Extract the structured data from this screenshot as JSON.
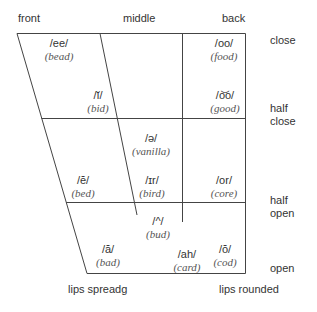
{
  "columns": {
    "front": "front",
    "middle": "middle",
    "back": "back"
  },
  "rows": {
    "close": "close",
    "half_close_1": "half",
    "half_close_2": "close",
    "half_open_1": "half",
    "half_open_2": "open",
    "open": "open"
  },
  "footer": {
    "left": "lips spreadg",
    "right": "lips rounded"
  },
  "vowels": [
    {
      "symbol": "/ee/",
      "example": "(bead)"
    },
    {
      "symbol": "/oo/",
      "example": "(food)"
    },
    {
      "symbol": "/ĭ/",
      "example": "(bid)"
    },
    {
      "symbol": "/o͝o/",
      "example": "(good)"
    },
    {
      "symbol": "/ə/",
      "example": "(vanilla)"
    },
    {
      "symbol": "/ĕ/",
      "example": "(bed)"
    },
    {
      "symbol": "/ɪr/",
      "example": "(bird)"
    },
    {
      "symbol": "/or/",
      "example": "(core)"
    },
    {
      "symbol": "/^/",
      "example": "(bud)"
    },
    {
      "symbol": "/ă/",
      "example": "(bad)"
    },
    {
      "symbol": "/ah/",
      "example": "(card)"
    },
    {
      "symbol": "/ŏ/",
      "example": "(cod)"
    }
  ],
  "colors": {
    "line": "#444444",
    "text": "#333333",
    "example_text": "#555555"
  }
}
